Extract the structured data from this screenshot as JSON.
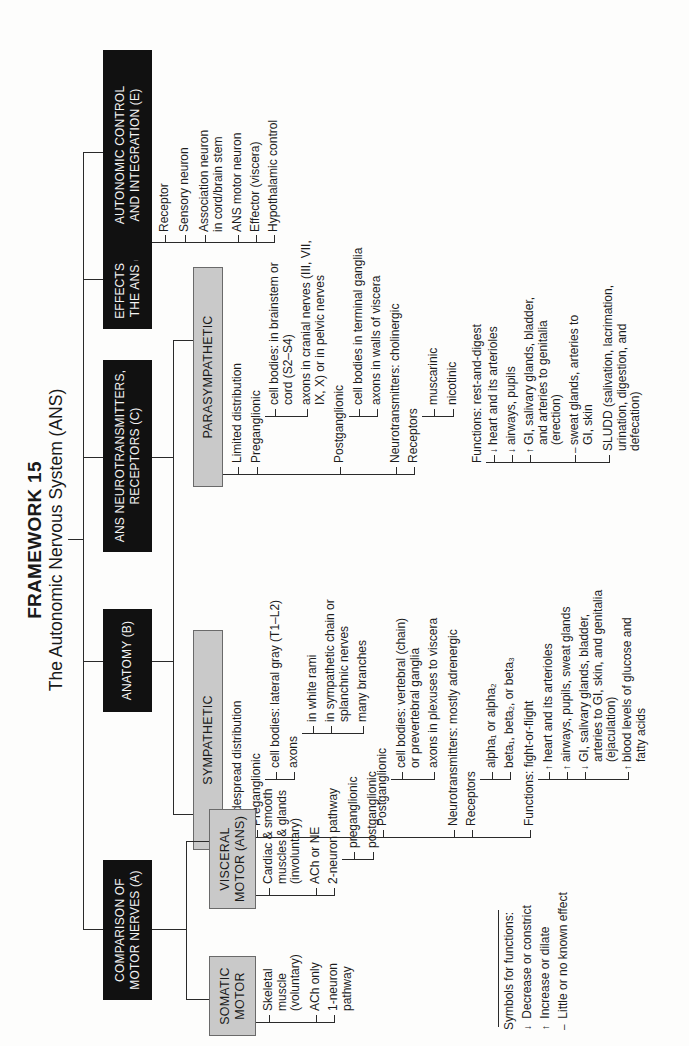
{
  "title": {
    "main": "FRAMEWORK 15",
    "sub": "The Autonomic Nervous System (ANS)"
  },
  "sections": {
    "A": {
      "label": "COMPARISON OF\nMOTOR NERVES (A)",
      "somatic": {
        "label": "SOMATIC\nMOTOR",
        "items": [
          "Skeletal\nmuscle\n(voluntary)",
          "ACh only",
          "1-neuron\npathway"
        ]
      },
      "visceral": {
        "label": "VISCERAL\nMOTOR (ANS)",
        "items": [
          "Cardiac  & smooth\nmuscles & glands\n(involuntary)",
          "ACh or NE",
          "2-neuron pathway"
        ],
        "subitems": [
          "preganglionic",
          "postganglionic"
        ]
      }
    },
    "B": {
      "label": "ANATOMY (B)"
    },
    "C": {
      "label": "ANS NEUROTRANSMITTERS,\nRECEPTORS (C)"
    },
    "D": {
      "label": "EFFECTS OF\nTHE ANS (D)"
    },
    "E": {
      "label": "AUTONOMIC CONTROL\nAND INTEGRATION (E)",
      "items": [
        "Receptor",
        "Sensory neuron",
        "Association neuron\nin cord/brain stem",
        "ANS motor neuron",
        "Effector (viscera)",
        "Hypothalamic control"
      ]
    }
  },
  "sympathetic": {
    "label": "SYMPATHETIC",
    "distribution": "Widespread distribution",
    "preganglionic": "Preganglionic",
    "pre_cell_bodies": "cell bodies: lateral gray (T1–L2)",
    "pre_axons": "axons",
    "axon_items": [
      "in white rami",
      "in sympathetic chain or\nsplanchnic nerves",
      "many branches"
    ],
    "postganglionic": "Postganglionic",
    "post_cell_bodies": "cell bodies: vertebral (chain)\nor prevertebral ganglia",
    "post_axons": "axons in plexuses to viscera",
    "neurotransmitters": "Neurotransmitters: mostly adrenergic",
    "receptors": "Receptors",
    "receptor_alpha": "alpha₁ or alpha₂",
    "receptor_beta": "beta₁, beta₂, or beta₃",
    "functions": "Functions: fight-or-flight",
    "function_items": [
      {
        "symbol": "↑",
        "text": "heart and its arterioles"
      },
      {
        "symbol": "↑",
        "text": "airways, pupils, sweat glands"
      },
      {
        "symbol": "↓",
        "text": "GI, salivary glands, bladder,\narteries to GI, skin, and genitalia\n(ejaculation)"
      },
      {
        "symbol": "↑",
        "text": "blood levels of glucose and\nfatty acids"
      }
    ]
  },
  "parasympathetic": {
    "label": "PARASYMPATHETIC",
    "distribution": "Limited distribution",
    "preganglionic": "Preganglionic",
    "pre_cell_bodies": "cell bodies: in brainstem or\ncord (S2–S4)",
    "pre_axons": "axons in cranial nerves (III, VII,\nIX, X) or in pelvic nerves",
    "postganglionic": "Postganglionic",
    "post_cell_bodies": "cell bodies in terminal ganglia",
    "post_axons": "axons in walls of viscera",
    "neurotransmitters": "Neurotransmitters: cholinergic",
    "receptors": "Receptors",
    "receptor_items": [
      "muscarinic",
      "nicotinic"
    ],
    "functions": "Functions: rest-and-digest",
    "function_items": [
      {
        "symbol": "↓",
        "text": "heart and its arterioles"
      },
      {
        "symbol": "↓",
        "text": "airways, pupils"
      },
      {
        "symbol": "↑",
        "text": "GI, salivary glands, bladder,\nand arteries to genitalia\n(erection)"
      },
      {
        "symbol": "–",
        "text": "sweat glands, arteries to\nGI, skin"
      },
      {
        "symbol": "",
        "text": "SLUDD (salivation, lacrimation,\nurination, digestion, and\ndefecation)"
      }
    ]
  },
  "legend": {
    "title": "Symbols for functions:",
    "items": [
      {
        "symbol": "↓",
        "text": "Decrease or constrict"
      },
      {
        "symbol": "↑",
        "text": "Increase or dilate"
      },
      {
        "symbol": "–",
        "text": "Little or no known effect"
      }
    ]
  },
  "colors": {
    "black_box": "#111111",
    "gray_box": "#c9c9c9",
    "line": "#2a2a2a",
    "background": "#fdfdfc"
  }
}
